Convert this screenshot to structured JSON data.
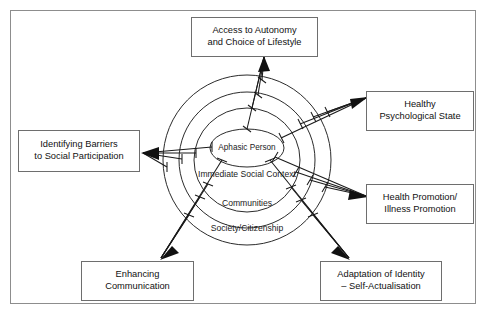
{
  "figure": {
    "type": "concentric-ellipse-influence-diagram",
    "frame_color": "#8d8d8d",
    "line_color": "#1a1a1a",
    "background": "#ffffff"
  },
  "rings": [
    {
      "id": "core",
      "label": "Aphasic Person",
      "level": 1
    },
    {
      "id": "immediate",
      "label_line1": "Immediate",
      "label_line2": "Social Context",
      "level": 2
    },
    {
      "id": "communities",
      "label": "Communities",
      "level": 3
    },
    {
      "id": "society",
      "label": "Society/Citizenship",
      "level": 4
    }
  ],
  "outcomes": [
    {
      "id": "access-autonomy",
      "position": "top",
      "line1": "Access to Autonomy",
      "line2": "and Choice of Lifestyle",
      "arrow_count": 4
    },
    {
      "id": "healthy-psychological-state",
      "position": "top-right",
      "line1": "Healthy",
      "line2": "Psychological State",
      "arrow_count": 4
    },
    {
      "id": "health-promotion",
      "position": "right",
      "line1": "Health Promotion/",
      "line2": "Illness Promotion",
      "arrow_count": 4
    },
    {
      "id": "adaptation-identity",
      "position": "bottom-right",
      "line1": "Adaptation of Identity",
      "line2": "– Self-Actualisation",
      "arrow_count": 4
    },
    {
      "id": "enhancing-communication",
      "position": "bottom-left",
      "line1": "Enhancing",
      "line2": "Communication",
      "arrow_count": 4
    },
    {
      "id": "identifying-barriers",
      "position": "left",
      "line1": "Identifying Barriers",
      "line2": "to Social Participation",
      "arrow_count": 4
    }
  ]
}
